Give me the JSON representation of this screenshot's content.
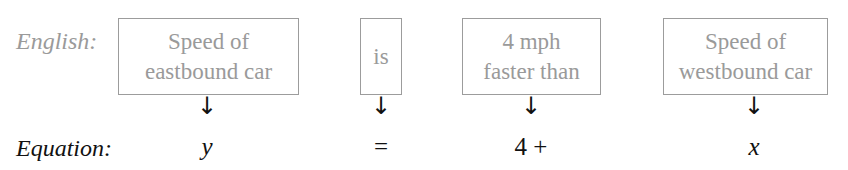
{
  "labels": {
    "english": "English:",
    "equation": "Equation:"
  },
  "columns": [
    {
      "box_lines": [
        "Speed of",
        "eastbound car"
      ],
      "arrow": "↓",
      "equation": "y"
    },
    {
      "box_lines": [
        "is"
      ],
      "arrow": "↓",
      "equation": "="
    },
    {
      "box_lines": [
        "4 mph",
        "faster than"
      ],
      "arrow": "↓",
      "equation": "4 +"
    },
    {
      "box_lines": [
        "Speed of",
        "westbound car"
      ],
      "arrow": "↓",
      "equation": "x"
    }
  ],
  "colors": {
    "box_border": "#9c9c9c",
    "box_text": "#9a9a9a",
    "equation_text": "#111111"
  }
}
